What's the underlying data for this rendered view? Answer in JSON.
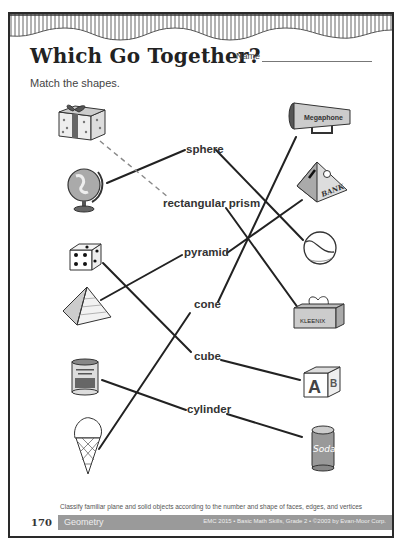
{
  "worksheet": {
    "title": "Which Go Together?",
    "name_label": "Name",
    "instructions": "Match the shapes.",
    "shape_words": [
      {
        "id": "sphere",
        "label": "sphere"
      },
      {
        "id": "rectangular-prism",
        "label": "rectangular prism"
      },
      {
        "id": "pyramid",
        "label": "pyramid"
      },
      {
        "id": "cone",
        "label": "cone"
      },
      {
        "id": "cube",
        "label": "cube"
      },
      {
        "id": "cylinder",
        "label": "cylinder"
      }
    ],
    "left_pictures": [
      "gift box",
      "globe",
      "die",
      "pyramid",
      "can",
      "ice cream cone"
    ],
    "right_pictures": [
      {
        "name": "megaphone",
        "text": "Megaphone"
      },
      {
        "name": "bank",
        "text": "BANK"
      },
      {
        "name": "baseball",
        "text": ""
      },
      {
        "name": "tissue box",
        "text": "KLEENIX"
      },
      {
        "name": "alphabet block",
        "text": "AB"
      },
      {
        "name": "soda can",
        "text": "Soda"
      }
    ],
    "matches": [
      {
        "picture": "gift box",
        "shape": "rectangular prism",
        "style": "dashed"
      },
      {
        "picture": "globe",
        "shape": "sphere",
        "style": "solid"
      },
      {
        "picture": "die",
        "shape": "cube",
        "style": "solid"
      },
      {
        "picture": "pyramid",
        "shape": "pyramid",
        "style": "solid"
      },
      {
        "picture": "can",
        "shape": "cylinder",
        "style": "solid"
      },
      {
        "picture": "ice cream cone",
        "shape": "cone",
        "style": "solid"
      },
      {
        "picture": "megaphone",
        "shape": "cone",
        "style": "solid"
      },
      {
        "picture": "bank",
        "shape": "pyramid",
        "style": "solid"
      },
      {
        "picture": "baseball",
        "shape": "sphere",
        "style": "solid"
      },
      {
        "picture": "tissue box",
        "shape": "rectangular prism",
        "style": "solid"
      },
      {
        "picture": "alphabet block",
        "shape": "cube",
        "style": "solid"
      },
      {
        "picture": "soda can",
        "shape": "cylinder",
        "style": "solid"
      }
    ]
  },
  "footer": {
    "standard_note": "Classify familiar plane and solid objects according to the number and shape of faces, edges, and vertices",
    "page_number": "170",
    "section": "Geometry",
    "copyright": "EMC 2015 • Basic Math Skills, Grade 2 • ©2003 by Evan-Moor Corp."
  },
  "colors": {
    "ink": "#222222",
    "footer_bar": "#9a9a9a"
  }
}
